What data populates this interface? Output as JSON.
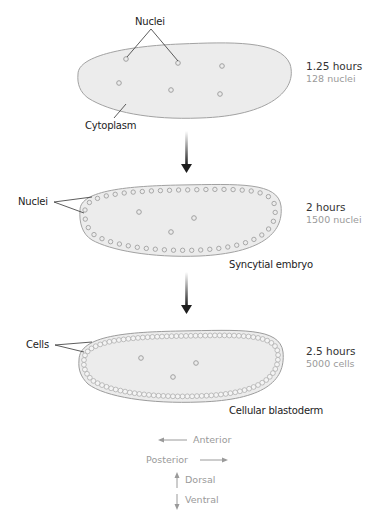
{
  "figure": {
    "stages": [
      {
        "time": "1.25 hours",
        "count": "128 nuclei",
        "pointer_label": "Nuclei",
        "secondary_label": "Cytoplasm"
      },
      {
        "time": "2 hours",
        "count": "1500 nuclei",
        "pointer_label": "Nuclei",
        "caption": "Syncytial embryo"
      },
      {
        "time": "2.5 hours",
        "count": "5000 cells",
        "pointer_label": "Cells",
        "caption": "Cellular blastoderm"
      }
    ],
    "orientation_key": {
      "anterior": "Anterior",
      "posterior": "Posterior",
      "dorsal": "Dorsal",
      "ventral": "Ventral"
    },
    "colors": {
      "embryo_fill": "#ececec",
      "embryo_stroke": "#9c9c9c",
      "nucleus_stroke": "#a0a0a0",
      "arrow_dark": "#222222",
      "key_gray": "#9a9a9a"
    }
  }
}
